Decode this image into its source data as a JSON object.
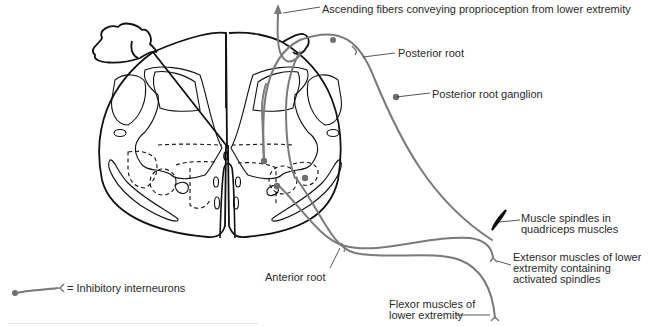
{
  "diagram": {
    "colors": {
      "outline": "#111111",
      "fiber": "#7a7a7a",
      "label_text": "#2a2a2a",
      "leader_line": "#444444"
    },
    "labels": {
      "ascending_fibers": "Ascending fibers conveying proprioception from lower extremity",
      "posterior_root": "Posterior root",
      "posterior_root_ganglion": "Posterior root ganglion",
      "muscle_spindles_line1": "Muscle spindles in",
      "muscle_spindles_line2": "quadriceps muscles",
      "extensor_line1": "Extensor muscles of lower",
      "extensor_line2": "extremity containing",
      "extensor_line3": "activated spindles",
      "anterior_root": "Anterior root",
      "flexor_line1": "Flexor muscles of",
      "flexor_line2": "lower extremity",
      "legend": "= Inhibitory interneurons"
    }
  }
}
